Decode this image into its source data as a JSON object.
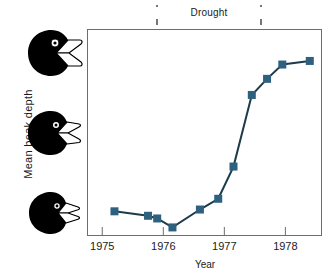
{
  "figure": {
    "annotation_label": "Drought",
    "y_axis_title": "Mean  beak  depth",
    "x_axis_title": "Year",
    "colors": {
      "series": "#2e6080",
      "drought_band": "#c9cda1",
      "frame": "#6d6d6d",
      "bird": "#000000"
    },
    "bird_icons": [
      {
        "name": "deep-beak-finch",
        "label": "deep beak finch"
      },
      {
        "name": "medium-beak-finch",
        "label": "medium beak finch"
      },
      {
        "name": "shallow-beak-finch",
        "label": "shallow beak finch"
      }
    ]
  },
  "chart_data": {
    "type": "line",
    "title": "",
    "xlabel": "Year",
    "ylabel": "Mean  beak  depth",
    "grid": false,
    "legend": null,
    "xlim": [
      1974.75,
      1978.6
    ],
    "ylim": [
      0,
      1
    ],
    "x_ticks": [
      1975,
      1976,
      1977,
      1978
    ],
    "x_tick_labels": [
      "1975",
      "1976",
      "1977",
      "1978"
    ],
    "y_ticks": [],
    "y_tick_labels": [],
    "annotations": [
      {
        "text": "Drought",
        "type": "span-bracket",
        "x_start": 1976.0,
        "x_end": 1977.45
      }
    ],
    "shaded_regions": [
      {
        "label": "Drought",
        "x_start": 1976.0,
        "x_end": 1977.45,
        "color": "#c9cda1"
      }
    ],
    "series": [
      {
        "name": "Mean beak depth",
        "color": "#2e6080",
        "marker": "square",
        "x": [
          1975.2,
          1975.75,
          1975.9,
          1976.15,
          1976.6,
          1976.9,
          1977.15,
          1977.45,
          1977.7,
          1977.95,
          1978.4
        ],
        "y": [
          0.11,
          0.085,
          0.07,
          0.02,
          0.12,
          0.18,
          0.36,
          0.76,
          0.85,
          0.93,
          0.95
        ]
      }
    ]
  }
}
